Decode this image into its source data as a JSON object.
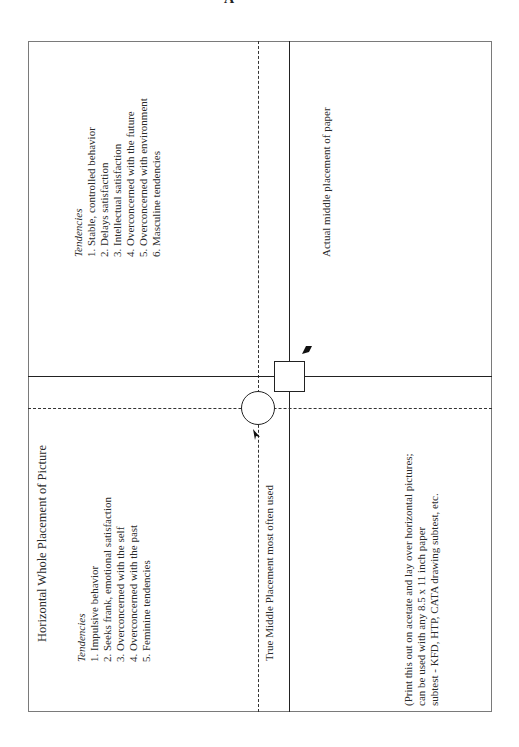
{
  "page": {
    "header_fragment": "A"
  },
  "upper_left": {
    "label": "Tendencies",
    "items": [
      "1. Stable, controlled behavior",
      "2. Delays satisfaction",
      "3. Intellectual satisfaction",
      "4. Overconcerned with the future",
      "5. Overconcerned with environment",
      "6. Masculine tendencies"
    ]
  },
  "lower_left": {
    "title": "Horizontal Whole Placement of Picture",
    "label": "Tendencies",
    "items": [
      "1. Impulsive behavior",
      "2. Seeks frank, emotional satisfaction",
      "3. Overconcerned with the self",
      "4. Overconcerned with the past",
      "5. Feminine tendencies"
    ]
  },
  "markers": {
    "true_middle_label": "True Middle Placement most often used",
    "actual_middle_label": "Actual middle placement of paper"
  },
  "note": {
    "lines": [
      "(Print this out on acetate and lay over horizontal pictures;",
      "can be used with any 8.5 x 11 inch paper",
      "subtest - KFD, HTP, CATA drawing subtest, etc."
    ]
  }
}
